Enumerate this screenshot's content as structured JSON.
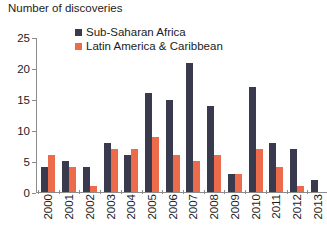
{
  "chart_data": {
    "type": "bar",
    "title": "Number of discoveries",
    "xlabel": "",
    "ylabel": "",
    "ylim": [
      0,
      25
    ],
    "yticks": [
      0,
      5,
      10,
      15,
      20,
      25
    ],
    "grid": false,
    "legend_position": "top-center",
    "categories": [
      "2000",
      "2001",
      "2002",
      "2003",
      "2004",
      "2005",
      "2006",
      "2007",
      "2008",
      "2009",
      "2010",
      "2011",
      "2012",
      "2013"
    ],
    "series": [
      {
        "name": "Sub-Saharan Africa",
        "color": "#3a3a4e",
        "values": [
          4,
          5,
          4,
          8,
          6,
          16,
          15,
          21,
          14,
          3,
          17,
          8,
          7,
          2
        ]
      },
      {
        "name": "Latin America & Caribbean",
        "color": "#ec6b4a",
        "values": [
          6,
          4,
          1,
          7,
          7,
          9,
          6,
          5,
          6,
          3,
          7,
          4,
          1,
          0
        ]
      }
    ]
  },
  "axis": {
    "y_tick_labels": [
      "25",
      "20",
      "15",
      "10",
      "5",
      "0"
    ]
  }
}
